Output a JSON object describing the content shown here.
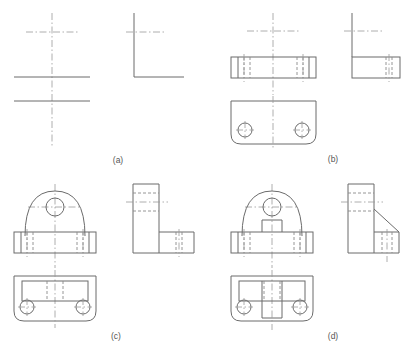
{
  "figure": {
    "type": "engineering-drawing",
    "panel_count": 4,
    "line_colors": {
      "object_line": "#6b6b6b",
      "hidden_line": "#8a8a8a",
      "center_line": "#9a9a9a",
      "caption_text": "#555555",
      "background": "#ffffff"
    },
    "panels": [
      {
        "id": "a",
        "caption": "(a)",
        "description": "Stage a: construction centrelines and datum lines only",
        "views": [
          "front-view",
          "side-view"
        ]
      },
      {
        "id": "b",
        "caption": "(b)",
        "description": "Stage b: base plate added in front, side and plan views with two holes",
        "views": [
          "front-view",
          "side-view",
          "plan-view"
        ]
      },
      {
        "id": "c",
        "caption": "(c)",
        "description": "Stage c: arched upright with bore added above base plate",
        "views": [
          "front-view",
          "side-view",
          "plan-view"
        ]
      },
      {
        "id": "d",
        "caption": "(d)",
        "description": "Stage d: central web rib added, completing the bracket",
        "views": [
          "front-view",
          "side-view",
          "plan-view"
        ]
      }
    ]
  },
  "captions": {
    "a": "(a)",
    "b": "(b)",
    "c": "(c)",
    "d": "(d)"
  }
}
